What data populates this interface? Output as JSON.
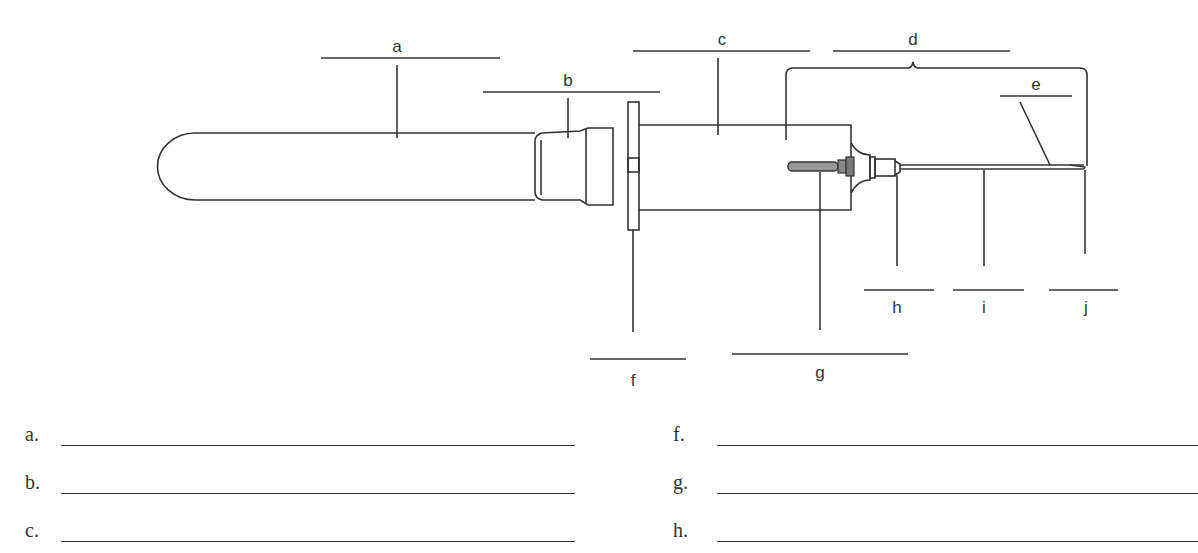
{
  "diagram": {
    "title_implied": "Evacuated tube blood collection assembly",
    "labels": {
      "a": "a",
      "b": "b",
      "c": "c",
      "d": "d",
      "e": "e",
      "f": "f",
      "g": "g",
      "h": "h",
      "i": "i",
      "j": "j"
    },
    "line_color": "#333333"
  },
  "answers": {
    "left": [
      {
        "letter": "a.",
        "value": ""
      },
      {
        "letter": "b.",
        "value": ""
      },
      {
        "letter": "c.",
        "value": ""
      }
    ],
    "right": [
      {
        "letter": "f.",
        "value": ""
      },
      {
        "letter": "g.",
        "value": ""
      },
      {
        "letter": "h.",
        "value": ""
      }
    ]
  }
}
